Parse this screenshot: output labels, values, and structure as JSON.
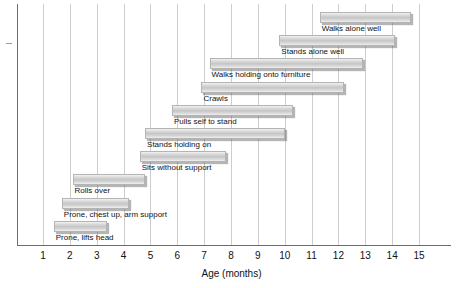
{
  "chart_data": {
    "type": "bar",
    "orientation": "horizontal",
    "subtype": "gantt-range",
    "title": "",
    "xlabel": "Age (months)",
    "ylabel": "",
    "xlim": [
      0,
      16.4
    ],
    "xticks": [
      1,
      2,
      3,
      4,
      5,
      6,
      7,
      8,
      9,
      10,
      11,
      12,
      13,
      14,
      15
    ],
    "xticklabels": [
      "1",
      "2",
      "3",
      "4",
      "5",
      "6",
      "7",
      "8",
      "9",
      "10",
      "11",
      "12",
      "13",
      "14",
      "15"
    ],
    "grid": true,
    "grid_axis": "x",
    "legend": false,
    "categories": [
      "Walks alone well",
      "Stands alone well",
      "Walks holding onto furniture",
      "Crawls",
      "Pulls self to stand",
      "Stands holding on",
      "Sits without support",
      "Rolls over",
      "Prone, chest up, arm support",
      "Prone, lifts head"
    ],
    "bars": [
      {
        "label": "Walks alone well",
        "start": 11.3,
        "end": 14.7
      },
      {
        "label": "Stands alone well",
        "start": 9.8,
        "end": 14.1
      },
      {
        "label": "Walks holding onto furniture",
        "start": 7.2,
        "end": 12.9
      },
      {
        "label": "Crawls",
        "start": 6.9,
        "end": 12.2
      },
      {
        "label": "Pulls self to stand",
        "start": 5.8,
        "end": 10.3
      },
      {
        "label": "Stands holding on",
        "start": 4.8,
        "end": 10.0
      },
      {
        "label": "Sits without support",
        "start": 4.6,
        "end": 7.8
      },
      {
        "label": "Rolls over",
        "start": 2.1,
        "end": 4.8
      },
      {
        "label": "Prone, chest up, arm support",
        "start": 1.7,
        "end": 4.2
      },
      {
        "label": "Prone, lifts head",
        "start": 1.4,
        "end": 3.4
      }
    ],
    "colors": {
      "bar_fill_light": "#f2f2f2",
      "bar_fill_mid": "#c6c6c6",
      "bar_border": "#b4b4b4",
      "gridline": "#cdcdcd",
      "axis": "#6d6d6d",
      "text": "#111111",
      "background": "#ffffff"
    }
  }
}
